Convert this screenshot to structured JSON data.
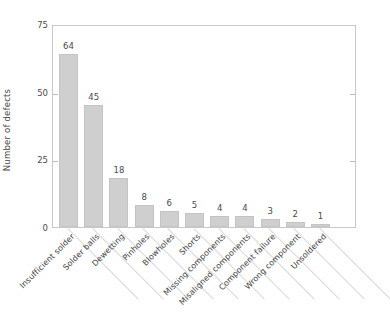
{
  "chart_data": {
    "type": "bar",
    "title": "",
    "xlabel": "",
    "ylabel": "Number of defects",
    "ylim": [
      0,
      75
    ],
    "yticks": [
      0,
      25,
      50,
      75
    ],
    "ytick_labels": [
      "0",
      "25",
      "50",
      "75"
    ],
    "grid": false,
    "legend": null,
    "bar_color": "#cfcfcf",
    "bar_edge_color": "#c4c4c4",
    "axis_color": "#c9c9c9",
    "text_color": "#3f3f3f",
    "data_labels_shown": true,
    "categories": [
      "Insufficient solder",
      "Solder balls",
      "Dewetting",
      "Pinholes",
      "Blowholes",
      "Shorts",
      "Missing components",
      "Misaligned components",
      "Component failure",
      "Wrong component",
      "Unsoldered"
    ],
    "values": [
      64,
      45,
      18,
      8,
      6,
      5,
      4,
      4,
      3,
      2,
      1
    ],
    "value_labels": [
      "64",
      "45",
      "18",
      "8",
      "6",
      "5",
      "4",
      "4",
      "3",
      "2",
      "1"
    ]
  }
}
